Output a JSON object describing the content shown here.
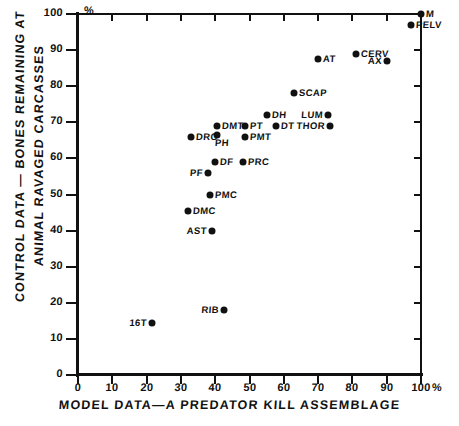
{
  "chart_data": {
    "type": "scatter",
    "title": "",
    "xlabel": "MODEL DATA—A PREDATOR KILL ASSEMBLAGE",
    "ylabel_line1": "CONTROL DATA — BONES REMAINING AT",
    "ylabel_line2": "ANIMAL RAVAGED CARCASSES",
    "xlim": [
      0,
      100
    ],
    "ylim": [
      0,
      100
    ],
    "xticks": [
      "0",
      "10",
      "20",
      "30",
      "40",
      "50",
      "60",
      "70",
      "80",
      "90",
      "100"
    ],
    "yticks": [
      "0",
      "10",
      "20",
      "30",
      "40",
      "50",
      "60",
      "70",
      "80",
      "90",
      "100"
    ],
    "x_unit_suffix": "%",
    "y_unit_suffix": "%",
    "grid": false,
    "legend": "none",
    "marker_color": "#111111",
    "axis_color": "#111111",
    "points": [
      {
        "label": "M",
        "x": 100,
        "y": 100,
        "label_pos": "right"
      },
      {
        "label": "PELV",
        "x": 97,
        "y": 97,
        "label_pos": "right"
      },
      {
        "label": "CERV",
        "x": 81,
        "y": 89,
        "label_pos": "right"
      },
      {
        "label": "AX",
        "x": 90,
        "y": 87,
        "label_pos": "left"
      },
      {
        "label": "AT",
        "x": 70,
        "y": 87.5,
        "label_pos": "right"
      },
      {
        "label": "SCAP",
        "x": 63,
        "y": 78,
        "label_pos": "right"
      },
      {
        "label": "LUM",
        "x": 73,
        "y": 72,
        "label_pos": "left"
      },
      {
        "label": "DH",
        "x": 55,
        "y": 72,
        "label_pos": "right"
      },
      {
        "label": "THOR",
        "x": 73.5,
        "y": 69,
        "label_pos": "left"
      },
      {
        "label": "DT",
        "x": 57.7,
        "y": 69,
        "label_pos": "right"
      },
      {
        "label": "PT",
        "x": 48.7,
        "y": 69,
        "label_pos": "right"
      },
      {
        "label": "DMT",
        "x": 40.5,
        "y": 69,
        "label_pos": "right"
      },
      {
        "label": "PH",
        "x": 40.5,
        "y": 66.5,
        "label_pos": "below"
      },
      {
        "label": "PMT",
        "x": 48.7,
        "y": 66,
        "label_pos": "right"
      },
      {
        "label": "DRC",
        "x": 33,
        "y": 66,
        "label_pos": "right"
      },
      {
        "label": "PRC",
        "x": 48,
        "y": 59,
        "label_pos": "right"
      },
      {
        "label": "DF",
        "x": 40,
        "y": 59,
        "label_pos": "right"
      },
      {
        "label": "PF",
        "x": 38,
        "y": 56,
        "label_pos": "left"
      },
      {
        "label": "PMC",
        "x": 38.5,
        "y": 50,
        "label_pos": "right"
      },
      {
        "label": "DMC",
        "x": 32,
        "y": 45.4,
        "label_pos": "right"
      },
      {
        "label": "AST",
        "x": 39,
        "y": 40,
        "label_pos": "left"
      },
      {
        "label": "RIB",
        "x": 42.5,
        "y": 18,
        "label_pos": "left"
      },
      {
        "label": "16T",
        "x": 21.5,
        "y": 14.5,
        "label_pos": "left"
      }
    ]
  }
}
